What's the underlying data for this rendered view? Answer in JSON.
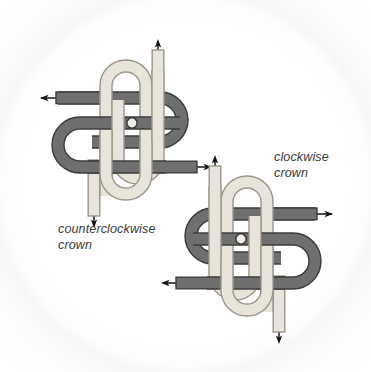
{
  "figure": {
    "background_color": "#ffffff",
    "rope_dark_color": "#6f6f6f",
    "rope_dark_edge_color": "#3c3c3c",
    "rope_light_color": "#e8e4da",
    "rope_light_edge_color": "#9a968c",
    "arrow_color": "#1a1a1a",
    "text_color": "#3b3b3b",
    "knots": [
      {
        "id": "counterclockwise-crown",
        "label": "counterclockwise\ncrown",
        "position": "upper-left",
        "arrows": [
          {
            "name": "arrow-up",
            "direction": "up",
            "strand": "light"
          },
          {
            "name": "arrow-left",
            "direction": "left",
            "strand": "dark"
          },
          {
            "name": "arrow-right",
            "direction": "right",
            "strand": "dark"
          },
          {
            "name": "arrow-down",
            "direction": "down",
            "strand": "light"
          }
        ]
      },
      {
        "id": "clockwise-crown",
        "label": "clockwise\ncrown",
        "position": "lower-right",
        "arrows": [
          {
            "name": "arrow-up",
            "direction": "up",
            "strand": "light"
          },
          {
            "name": "arrow-right",
            "direction": "right",
            "strand": "dark"
          },
          {
            "name": "arrow-left",
            "direction": "left",
            "strand": "dark"
          },
          {
            "name": "arrow-down",
            "direction": "down",
            "strand": "light"
          }
        ]
      }
    ]
  },
  "captions": {
    "counterclockwise": "counterclockwise\ncrown",
    "clockwise": "clockwise\ncrown"
  }
}
